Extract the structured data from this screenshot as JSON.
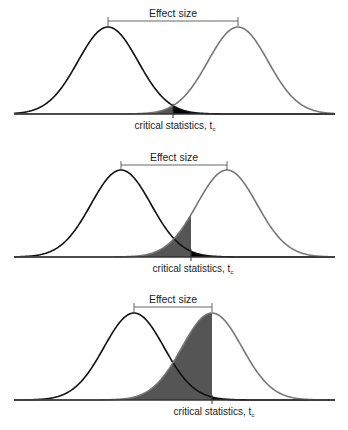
{
  "figure": {
    "colors": {
      "null_curve": "#111111",
      "alt_curve": "#777777",
      "power_fill": "#555555",
      "alpha_fill": "#000000",
      "baseline": "#333333",
      "bracket": "#555555"
    },
    "sigma": 30,
    "peak_height": 87,
    "x_min": 14,
    "x_max": 335,
    "panels": [
      {
        "effect_label": "Effect size",
        "critical_label": "critical statistics, t",
        "critical_subscript": "c",
        "baseline_y": 114,
        "null_mean_x": 108,
        "alt_mean_x": 238,
        "critical_x": 173,
        "bracket_y": 21,
        "effect_text_y": 17,
        "label_y": 129
      },
      {
        "effect_label": "Effect size",
        "critical_label": "critical statistics, t",
        "critical_subscript": "c",
        "baseline_y": 257,
        "null_mean_x": 121,
        "alt_mean_x": 227,
        "critical_x": 191,
        "bracket_y": 165,
        "effect_text_y": 161,
        "label_y": 272
      },
      {
        "effect_label": "Effect size",
        "critical_label": "critical statistics, t",
        "critical_subscript": "c",
        "baseline_y": 400,
        "null_mean_x": 134,
        "alt_mean_x": 212,
        "critical_x": 212,
        "bracket_y": 307,
        "effect_text_y": 303,
        "label_y": 415
      }
    ]
  }
}
